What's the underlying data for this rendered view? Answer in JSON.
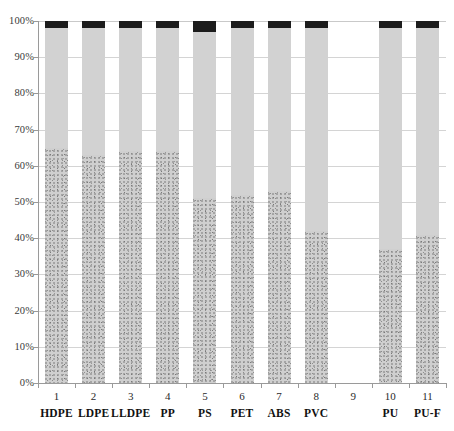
{
  "chart_data": {
    "type": "bar",
    "subtype": "100% stacked column",
    "title": "",
    "xlabel": "",
    "ylabel": "",
    "ylim": [
      0,
      100
    ],
    "ytick_labels": [
      "0%",
      "10%",
      "20%",
      "30%",
      "40%",
      "50%",
      "60%",
      "70%",
      "80%",
      "90%",
      "100%"
    ],
    "ytick_values": [
      0,
      10,
      20,
      30,
      40,
      50,
      60,
      70,
      80,
      90,
      100
    ],
    "grid": true,
    "legend": "none",
    "x_numbers": [
      "1",
      "2",
      "3",
      "4",
      "5",
      "6",
      "7",
      "8",
      "9",
      "10",
      "11"
    ],
    "categories": [
      "HDPE",
      "LDPE",
      "LLDPE",
      "PP",
      "PS",
      "PET",
      "ABS",
      "PVC",
      "",
      "PU",
      "PU-F"
    ],
    "series": [
      {
        "name": "bottom-segment",
        "pattern": "speckled-grey",
        "color": "#cfcfcf",
        "values": [
          65,
          63,
          64,
          64,
          51,
          52,
          53,
          42,
          null,
          37,
          41
        ]
      },
      {
        "name": "middle-segment",
        "pattern": "solid-light-grey",
        "color": "#d2d2d2",
        "values": [
          33,
          35,
          34,
          34,
          46,
          46,
          45,
          56,
          null,
          61,
          57
        ]
      },
      {
        "name": "top-segment",
        "pattern": "solid-black",
        "color": "#1c1c1c",
        "values": [
          2,
          2,
          2,
          2,
          3,
          2,
          2,
          2,
          null,
          2,
          2
        ]
      }
    ],
    "empty_positions": [
      9
    ],
    "colors": {
      "bottom": "#cfcfcf",
      "middle": "#d2d2d2",
      "top": "#1c1c1c",
      "gridline": "#d4d4d4",
      "axis": "#9a9a9a",
      "text": "#1a1a1a",
      "background": "#ffffff"
    }
  }
}
